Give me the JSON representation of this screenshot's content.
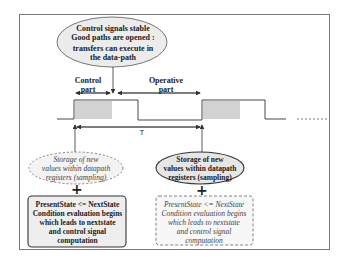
{
  "diagram": {
    "top_callout": {
      "lines": [
        "Control signals stable",
        "Good paths are opened :",
        "transfers can execute in",
        "the data-path"
      ]
    },
    "phase_labels": {
      "control": [
        "Control",
        "part"
      ],
      "operative": [
        "Operative",
        "part"
      ]
    },
    "period_label": "T",
    "left_sampling": {
      "style": "dashed-italic",
      "lines": [
        "Storage of new",
        "values within datapath",
        "registers (sampling)"
      ]
    },
    "right_sampling": {
      "style": "solid-bold",
      "lines": [
        "Storage of new",
        "values within datapath",
        "registers (sampling)"
      ]
    },
    "plus_symbol": "+",
    "left_state_box": {
      "style": "solid-bold",
      "lines": [
        "PresentState <= NextState",
        "Condition evaluation begins",
        "which leads to nextstate",
        "and control signal",
        "computation"
      ]
    },
    "right_state_box": {
      "style": "dashed-italic",
      "lines": [
        "PresentState <= NextState",
        "Condition evaluation begins",
        "which leads to nextstate",
        "and control signal",
        "computation"
      ]
    },
    "colors": {
      "line": "#333333",
      "shade": "#cfcfcf",
      "frame": "#7a7a7a"
    }
  }
}
